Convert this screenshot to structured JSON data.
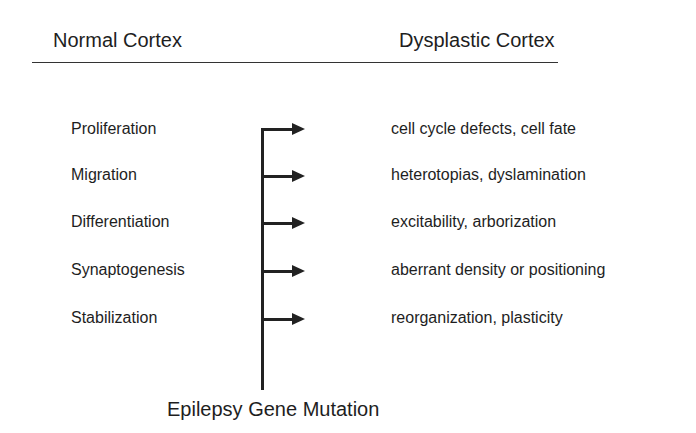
{
  "headers": {
    "left": "Normal Cortex",
    "right": "Dysplastic Cortex"
  },
  "rows": [
    {
      "stage": "Proliferation",
      "effect": "cell cycle defects, cell fate"
    },
    {
      "stage": "Migration",
      "effect": "heterotopias, dyslamination"
    },
    {
      "stage": "Differentiation",
      "effect": "excitability, arborization"
    },
    {
      "stage": "Synaptogenesis",
      "effect": "aberrant density or positioning"
    },
    {
      "stage": "Stabilization",
      "effect": "reorganization, plasticity"
    }
  ],
  "footer": "Epilepsy Gene Mutation",
  "icons": {
    "arrow": "right-arrow-icon"
  },
  "colors": {
    "line": "#222222",
    "text": "#1e1e1e",
    "background": "#ffffff"
  }
}
